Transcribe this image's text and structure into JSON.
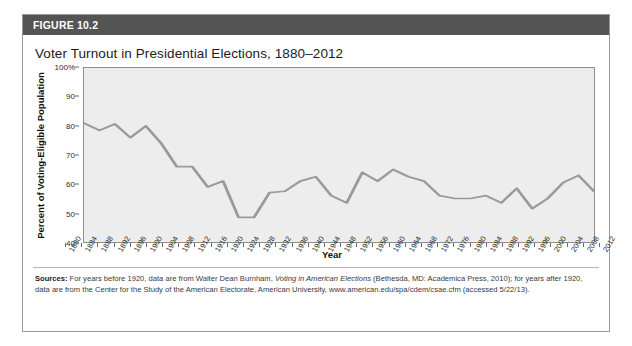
{
  "figure": {
    "label": "FIGURE 10.2",
    "title": "Voter Turnout in Presidential Elections, 1880–2012",
    "header_color": "#545454",
    "plot_background": "#ededed",
    "line_color": "#9a9a9a"
  },
  "source": {
    "prefix": "Sources:",
    "part1": " For years before 1920, data are from Walter Dean Burnham, ",
    "italic1": "Voting in American Elections",
    "part2": " (Bethesda, MD: Academica Press, 2010); for years after 1920, data are from the Center for the Study of the American Electorate, American University, www.american.edu/spa/cdem/csae.cfm (accessed 5/22/13)."
  },
  "chart_data": {
    "type": "line",
    "title": "Voter Turnout in Presidential Elections, 1880–2012",
    "xlabel": "Year",
    "ylabel": "Percent of Voting-Eligible Population",
    "ylim": [
      40,
      100
    ],
    "yticks": [
      40,
      50,
      60,
      70,
      80,
      90,
      100
    ],
    "ytick_labels": [
      "40",
      "50",
      "60",
      "70",
      "80",
      "90",
      "100%"
    ],
    "grid": false,
    "legend": false,
    "x": [
      1880,
      1884,
      1888,
      1892,
      1896,
      1900,
      1904,
      1908,
      1912,
      1916,
      1920,
      1924,
      1928,
      1932,
      1936,
      1940,
      1944,
      1948,
      1952,
      1956,
      1960,
      1964,
      1968,
      1972,
      1976,
      1980,
      1984,
      1988,
      1992,
      1996,
      2000,
      2004,
      2008,
      2012
    ],
    "categories": [
      "1880",
      "1884",
      "1888",
      "1892",
      "1896",
      "1900",
      "1904",
      "1908",
      "1912",
      "1916",
      "1920",
      "1924",
      "1928",
      "1932",
      "1936",
      "1940",
      "1944",
      "1948",
      "1952",
      "1956",
      "1960",
      "1964",
      "1968",
      "1972",
      "1976",
      "1980",
      "1984",
      "1988",
      "1992",
      "1996",
      "2000",
      "2004",
      "2008",
      "2012"
    ],
    "values": [
      81.0,
      78.5,
      80.7,
      76.0,
      80.0,
      74.0,
      66.0,
      66.0,
      59.0,
      61.0,
      48.5,
      48.5,
      57.0,
      57.5,
      61.0,
      62.5,
      56.0,
      53.5,
      64.0,
      61.0,
      65.0,
      62.5,
      61.0,
      56.0,
      55.0,
      55.0,
      56.0,
      53.5,
      58.5,
      51.5,
      55.0,
      60.5,
      63.0,
      57.5
    ],
    "series": [
      {
        "name": "Voter turnout",
        "values": [
          81.0,
          78.5,
          80.7,
          76.0,
          80.0,
          74.0,
          66.0,
          66.0,
          59.0,
          61.0,
          48.5,
          48.5,
          57.0,
          57.5,
          61.0,
          62.5,
          56.0,
          53.5,
          64.0,
          61.0,
          65.0,
          62.5,
          61.0,
          56.0,
          55.0,
          55.0,
          56.0,
          53.5,
          58.5,
          51.5,
          55.0,
          60.5,
          63.0,
          57.5
        ]
      }
    ]
  }
}
